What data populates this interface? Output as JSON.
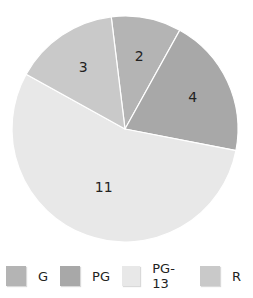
{
  "chart_data": {
    "type": "pie",
    "title": "",
    "categories": [
      "G",
      "PG",
      "PG-13",
      "R"
    ],
    "values": [
      2,
      4,
      11,
      3
    ],
    "colors": [
      "#b4b4b4",
      "#a8a8a8",
      "#e8e8e8",
      "#c9c9c9"
    ],
    "data_labels": [
      "2",
      "4",
      "11",
      "3"
    ],
    "start_angle_deg": -7,
    "legend_position": "bottom"
  },
  "legend": [
    {
      "label": "G",
      "color": "#b4b4b4"
    },
    {
      "label": "PG",
      "color": "#a8a8a8"
    },
    {
      "label": "PG-13",
      "color": "#e8e8e8"
    },
    {
      "label": "R",
      "color": "#c9c9c9"
    }
  ]
}
